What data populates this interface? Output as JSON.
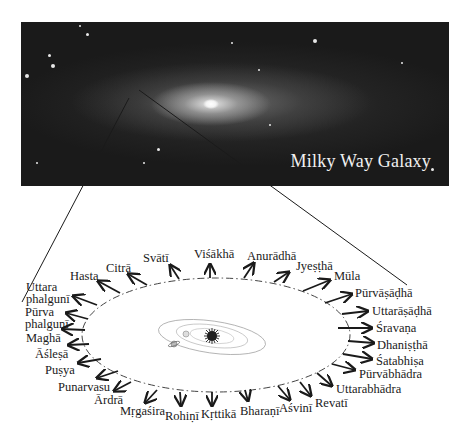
{
  "galaxy": {
    "label": "Milky Way Galaxy",
    "background_color": "#1a1a1a",
    "label_color": "#f0f0f0"
  },
  "solar_system": {
    "description": "Sun with orbiting planets (illustration at center of ecliptic)"
  },
  "ecliptic": {
    "style": "dash-dot ellipse",
    "center": [
      216,
      335
    ],
    "rx": 134,
    "ry": 57
  },
  "nakshatras": [
    {
      "name": "Aśvinī"
    },
    {
      "name": "Bharaṇī"
    },
    {
      "name": "Kṛttikā"
    },
    {
      "name": "Rohiṇī"
    },
    {
      "name": "Mṛgaśira"
    },
    {
      "name": "Ārdrā"
    },
    {
      "name": "Punarvasu"
    },
    {
      "name": "Puṣya"
    },
    {
      "name": "Āśleṣā"
    },
    {
      "name": "Maghā"
    },
    {
      "name": "Pūrva\nphalgunī",
      "line1": "Pūrva",
      "line2": "phalgunī"
    },
    {
      "name": "Uttara\nphalgunī",
      "line1": "Uttara",
      "line2": "phalgunī"
    },
    {
      "name": "Hasta"
    },
    {
      "name": "Citrā"
    },
    {
      "name": "Svātī"
    },
    {
      "name": "Viśākhā"
    },
    {
      "name": "Anurādhā"
    },
    {
      "name": "Jyeṣṭhā"
    },
    {
      "name": "Mūla"
    },
    {
      "name": "Pūrvāṣāḍhā"
    },
    {
      "name": "Uttarāṣāḍhā"
    },
    {
      "name": "Śravaṇa"
    },
    {
      "name": "Dhaniṣṭhā"
    },
    {
      "name": "Śatabhiṣa"
    },
    {
      "name": "Pūrvābhādra"
    },
    {
      "name": "Uttarabhādra"
    },
    {
      "name": "Revatī"
    }
  ]
}
